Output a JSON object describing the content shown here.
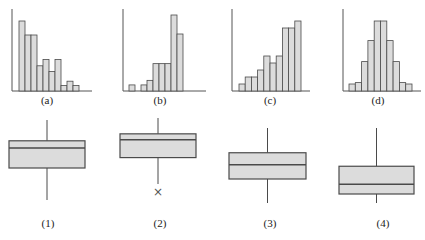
{
  "chart_data": [
    {
      "type": "bar",
      "label": "(a)",
      "title": "",
      "xlabel": "",
      "ylabel": "",
      "shape": "right-skewed",
      "categories": [
        "1",
        "2",
        "3",
        "4",
        "5",
        "6",
        "7",
        "8",
        "9",
        "10"
      ],
      "values": [
        10,
        8,
        8,
        3.6,
        4.5,
        2.8,
        4.5,
        0.8,
        1.4,
        0.8
      ],
      "grid": false
    },
    {
      "type": "bar",
      "label": "(b)",
      "title": "",
      "xlabel": "",
      "ylabel": "",
      "shape": "left-skewed",
      "categories": [
        "1",
        "2",
        "3",
        "4",
        "5",
        "6",
        "7",
        "8",
        "9"
      ],
      "values": [
        0.8,
        0,
        0.8,
        1.4,
        3.6,
        3.6,
        3.6,
        10,
        7.5
      ],
      "grid": false
    },
    {
      "type": "bar",
      "label": "(c)",
      "title": "",
      "xlabel": "",
      "ylabel": "",
      "shape": "left-skewed",
      "categories": [
        "1",
        "2",
        "3",
        "4",
        "5",
        "6",
        "7",
        "8",
        "9",
        "10"
      ],
      "values": [
        1,
        2,
        2,
        3,
        5,
        4,
        5,
        9,
        9,
        10
      ],
      "grid": false
    },
    {
      "type": "bar",
      "label": "(d)",
      "title": "",
      "xlabel": "",
      "ylabel": "",
      "shape": "symmetric",
      "categories": [
        "1",
        "2",
        "3",
        "4",
        "5",
        "6",
        "7",
        "8",
        "9",
        "10",
        "11"
      ],
      "values": [
        1,
        1.2,
        4.2,
        7.2,
        10,
        10,
        7.2,
        4.2,
        1.2,
        1
      ],
      "grid": false
    },
    {
      "type": "boxplot",
      "label": "(1)",
      "orientation": "vertical",
      "whisker_high": 100,
      "q3": 74,
      "median": 65,
      "q1": 40,
      "whisker_low": 0,
      "outliers": []
    },
    {
      "type": "boxplot",
      "label": "(2)",
      "orientation": "vertical",
      "whisker_high": 100,
      "q3": 76,
      "median": 67,
      "q1": 40,
      "whisker_low": 0,
      "outliers": [
        {
          "marker": "×",
          "value": -12
        }
      ]
    },
    {
      "type": "boxplot",
      "label": "(3)",
      "orientation": "vertical",
      "whisker_high": 100,
      "q3": 67,
      "median": 51,
      "q1": 32,
      "whisker_low": 0,
      "outliers": []
    },
    {
      "type": "boxplot",
      "label": "(4)",
      "orientation": "vertical",
      "whisker_high": 100,
      "q3": 49,
      "median": 25,
      "q1": 12,
      "whisker_low": 0,
      "outliers": []
    }
  ],
  "labels": {
    "a": "(a)",
    "b": "(b)",
    "c": "(c)",
    "d": "(d)",
    "p1": "(1)",
    "p2": "(2)",
    "p3": "(3)",
    "p4": "(4)"
  },
  "colors": {
    "bar_fill": "#dcdcdc",
    "stroke": "#4a4a4a",
    "axis": "#555555",
    "outlier": "#555555"
  }
}
